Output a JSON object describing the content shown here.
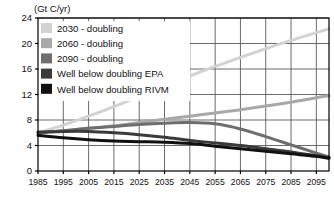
{
  "chart_data": {
    "type": "line",
    "title": "",
    "ylabel": "(Gt C/yr)",
    "xlabel": "",
    "xlim": [
      1985,
      2100
    ],
    "ylim": [
      0,
      24
    ],
    "yticks": [
      0,
      4,
      8,
      12,
      16,
      20,
      24
    ],
    "xticks": [
      1985,
      1995,
      2005,
      2015,
      2025,
      2035,
      2045,
      2055,
      2065,
      2075,
      2085,
      2095
    ],
    "grid": true,
    "legend_position": "top-left",
    "x": [
      1985,
      1995,
      2005,
      2015,
      2025,
      2035,
      2045,
      2055,
      2065,
      2075,
      2085,
      2095,
      2100
    ],
    "series": [
      {
        "name": "2030 - doubling",
        "color": "#d2d2d2",
        "values": [
          6.0,
          7.2,
          8.6,
          10.1,
          11.7,
          13.3,
          14.9,
          16.4,
          17.8,
          19.2,
          20.5,
          21.7,
          22.3
        ]
      },
      {
        "name": "2060 - doubling",
        "color": "#a8a8a8",
        "values": [
          6.0,
          6.3,
          6.7,
          7.1,
          7.6,
          8.1,
          8.6,
          9.1,
          9.6,
          10.2,
          10.8,
          11.5,
          11.8
        ]
      },
      {
        "name": "2090 - doubling",
        "color": "#6e6e6e",
        "values": [
          6.0,
          6.3,
          6.7,
          7.0,
          7.3,
          7.5,
          7.6,
          7.4,
          6.6,
          5.4,
          4.1,
          2.8,
          2.2
        ]
      },
      {
        "name": "Well below doubling EPA",
        "color": "#3a3a3a",
        "values": [
          6.1,
          6.2,
          6.2,
          6.0,
          5.7,
          5.3,
          4.8,
          4.4,
          4.0,
          3.5,
          3.0,
          2.4,
          2.1
        ]
      },
      {
        "name": "Well below doubling RIVM",
        "color": "#111111",
        "values": [
          5.6,
          5.2,
          4.9,
          4.7,
          4.6,
          4.5,
          4.3,
          3.9,
          3.5,
          3.1,
          2.7,
          2.3,
          2.0
        ]
      }
    ],
    "legend": [
      {
        "label": "2030 - doubling",
        "swatch": "#d2d2d2"
      },
      {
        "label": "2060 - doubling",
        "swatch": "#a8a8a8"
      },
      {
        "label": "2090 - doubling",
        "swatch": "#6e6e6e"
      },
      {
        "label": "Well below doubling EPA",
        "swatch": "#3a3a3a"
      },
      {
        "label": "Well below doubling RIVM",
        "swatch": "#111111"
      }
    ],
    "colors": {
      "axis": "#000000",
      "grid": "#5a5a5a",
      "background": "#ffffff",
      "text": "#111111"
    }
  }
}
